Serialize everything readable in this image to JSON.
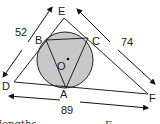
{
  "diagram": {
    "type": "geometry",
    "colors": {
      "circle_fill": "#c8c8c8",
      "line": "#222222"
    },
    "points": {
      "E": "E",
      "B": "B",
      "C": "C",
      "O": "O",
      "D": "D",
      "A": "A",
      "F": "F"
    },
    "side_lengths": {
      "DE": "52",
      "EF": "74",
      "DF": "89"
    },
    "cropped_text": {
      "left": "lengths",
      "right": "E"
    }
  }
}
